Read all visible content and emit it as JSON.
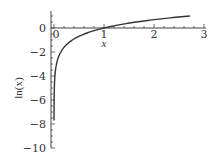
{
  "chart_data": {
    "type": "line",
    "title": "",
    "xlabel": "x",
    "ylabel": "ln(x)",
    "xlim": [
      0,
      3
    ],
    "ylim": [
      -10,
      1
    ],
    "xticks": [
      0,
      1,
      2,
      3
    ],
    "xtick_labels": [
      "0",
      "1",
      "2",
      "3"
    ],
    "yticks": [
      0,
      -2,
      -4,
      -6,
      -8,
      -10
    ],
    "ytick_labels": [
      "0",
      "−2",
      "−4",
      "−6",
      "−8",
      "−10"
    ],
    "grid": false,
    "legend": null,
    "series": [
      {
        "name": "ln(x)",
        "function": "ln(x)",
        "x_range": [
          0.00045,
          2.718
        ],
        "color": "#333333"
      }
    ]
  }
}
